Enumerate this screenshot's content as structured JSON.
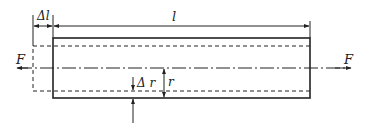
{
  "diagram": {
    "labels": {
      "delta_l": "Δl",
      "l": "l",
      "force_left": "F",
      "force_right": "F",
      "delta_r": "Δ r",
      "r": "r"
    },
    "colors": {
      "stroke": "#222222",
      "background": "#ffffff"
    }
  }
}
